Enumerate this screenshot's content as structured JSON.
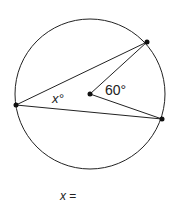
{
  "diagram": {
    "type": "circle-inscribed-angle",
    "circle": {
      "cx": 90,
      "cy": 94,
      "r": 75
    },
    "points": {
      "left": {
        "x": 16,
        "y": 105
      },
      "top_right": {
        "x": 147,
        "y": 42
      },
      "bottom_right": {
        "x": 162,
        "y": 119
      },
      "center": {
        "x": 90,
        "y": 94
      }
    },
    "labels": {
      "inscribed_angle": "x°",
      "central_angle": "60°"
    }
  },
  "answer": {
    "variable": "x",
    "equals": "="
  }
}
